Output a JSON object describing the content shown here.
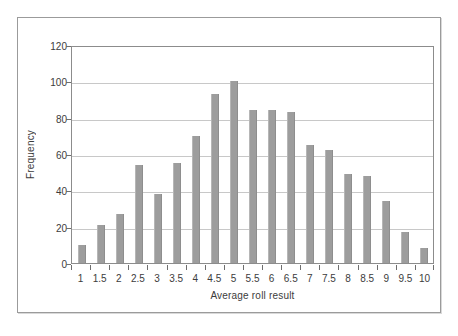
{
  "chart_data": {
    "type": "bar",
    "title": "",
    "subtitle": "",
    "xlabel": "Average roll result",
    "ylabel": "Frequency",
    "categories": [
      "1",
      "1.5",
      "2",
      "2.5",
      "3",
      "3.5",
      "4",
      "4.5",
      "5",
      "5.5",
      "6",
      "6.5",
      "7",
      "7.5",
      "8",
      "8.5",
      "9",
      "9.5",
      "10"
    ],
    "values": [
      10,
      21,
      27,
      54,
      38,
      55,
      70,
      93,
      100,
      84,
      84,
      83,
      65,
      62,
      49,
      48,
      34,
      17,
      8
    ],
    "series": [
      {
        "name": "Frequency",
        "values": [
          10,
          21,
          27,
          54,
          38,
          55,
          70,
          93,
          100,
          84,
          84,
          83,
          65,
          62,
          49,
          48,
          34,
          17,
          8
        ]
      }
    ],
    "ylim": [
      0,
      120
    ],
    "yticks": [
      0,
      20,
      40,
      60,
      80,
      100,
      120
    ],
    "ytick_labels": [
      "0",
      "20",
      "40",
      "60",
      "80",
      "100",
      "120"
    ],
    "grid": "horizontal",
    "legend": "none",
    "bar_color": "#9d9d9d",
    "gridline_color": "#c8c8c8",
    "axis_color": "#8c8c8c",
    "text_color": "#3c3c3c",
    "background": "#ffffff",
    "frame_color": "#9b9b9b"
  }
}
